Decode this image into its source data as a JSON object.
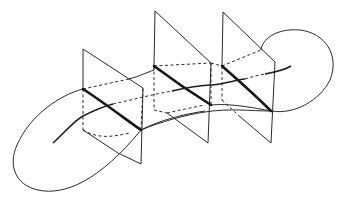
{
  "figure": {
    "stroke_color": "#1e1e1e",
    "background": "#ffffff",
    "planes": [
      {
        "name": "plane-1"
      },
      {
        "name": "plane-2"
      },
      {
        "name": "plane-3"
      }
    ]
  }
}
